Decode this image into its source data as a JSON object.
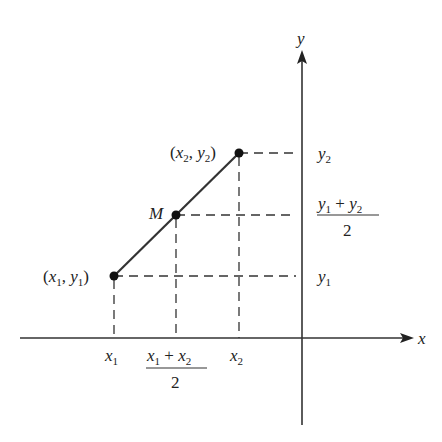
{
  "diagram": {
    "axes": {
      "x_label": "x",
      "y_label": "y"
    },
    "points": [
      {
        "name": "P1",
        "label_open": "(",
        "label_var1": "x",
        "label_sub1": "1",
        "label_var2": "y",
        "label_sub2": "1",
        "label_close": ")"
      },
      {
        "name": "P2",
        "label_var1": "x",
        "label_sub1": "2",
        "label_var2": "y",
        "label_sub2": "2"
      },
      {
        "name": "M",
        "label": "M"
      }
    ],
    "x_ticks": {
      "x1": "x",
      "x1_sub": "1",
      "x2": "x",
      "x2_sub": "2",
      "mid_num": "x1 + x2",
      "mid_den": "2"
    },
    "y_ticks": {
      "y1": "y",
      "y1_sub": "1",
      "y2": "y",
      "y2_sub": "2",
      "mid_num": "y1 + y2",
      "mid_den": "2"
    },
    "colors": {
      "line": "#333333",
      "text": "#222222",
      "background": "#ffffff"
    }
  }
}
